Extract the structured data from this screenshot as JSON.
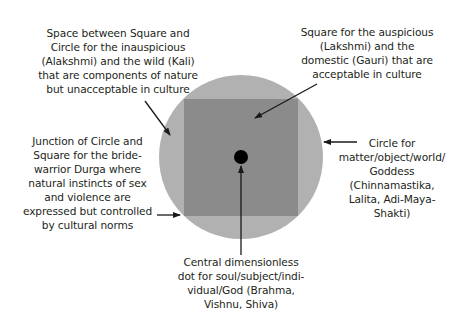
{
  "colors": {
    "background": "#ffffff",
    "circle": "#b1b1b1",
    "square": "#8b8b8b",
    "dot": "#000000",
    "text": "#231f20",
    "arrow": "#1a1a1a"
  },
  "shapes": {
    "circle": {
      "cx": 241,
      "cy": 157,
      "r": 82
    },
    "square": {
      "x": 184,
      "y": 99,
      "w": 114,
      "h": 117
    },
    "dot": {
      "cx": 241,
      "cy": 157,
      "r": 7
    }
  },
  "labels": {
    "space_between": {
      "lines": [
        "Space between Square and",
        "Circle for the inauspicious",
        "(Alakshmi) and the wild (Kali)",
        "that are components of nature",
        "but unacceptable in culture"
      ]
    },
    "square": {
      "lines": [
        "Square for the auspicious",
        "(Lakshmi) and the",
        "domestic (Gauri) that are",
        "acceptable in culture"
      ]
    },
    "junction": {
      "lines": [
        "Junction of Circle and",
        "Square for the bride-",
        "warrior Durga where",
        "natural instincts of sex",
        "and violence are",
        "expressed but controlled",
        "by cultural norms"
      ]
    },
    "circle": {
      "lines": [
        "Circle for",
        "matter/object/world/",
        "Goddess",
        "(Chinnamastika,",
        "Lalita, Adi-Maya-",
        "Shakti)"
      ]
    },
    "dot": {
      "lines": [
        "Central dimensionless",
        "dot for soul/subject/indi-",
        "vidual/God (Brahma,",
        "Vishnu, Shiva)"
      ]
    }
  }
}
